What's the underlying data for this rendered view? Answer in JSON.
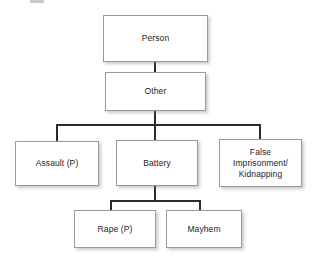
{
  "diagram": {
    "type": "hierarchy-tree",
    "orientation": "top-down",
    "background_color": "#ffffff",
    "box_fill_color": "#ffffff",
    "box_border_color": "#9a9a9a",
    "connector_color": "#2b2b2b",
    "text_color": "#1c1c1c",
    "levels": 4,
    "nodes": [
      {
        "id": "person",
        "label": "Person",
        "level": 1,
        "parent": null
      },
      {
        "id": "other",
        "label": "Other",
        "level": 2,
        "parent": "person"
      },
      {
        "id": "assault",
        "label": "Assault (P)",
        "level": 3,
        "parent": "other"
      },
      {
        "id": "battery",
        "label": "Battery",
        "level": 3,
        "parent": "other"
      },
      {
        "id": "false_imprisonment",
        "label": "False\nImprisonment/\nKidnapping",
        "level": 3,
        "parent": "other"
      },
      {
        "id": "rape",
        "label": "Rape (P)",
        "level": 4,
        "parent": "battery"
      },
      {
        "id": "mayhem",
        "label": "Mayhem",
        "level": 4,
        "parent": "battery"
      }
    ]
  }
}
